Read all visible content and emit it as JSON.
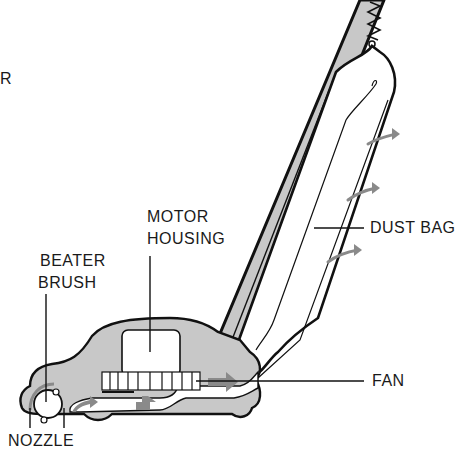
{
  "diagram": {
    "colors": {
      "line": "#111111",
      "body_fill": "#c8c8c8",
      "airflow_arrow": "#8a8a8a",
      "background": "#ffffff"
    },
    "labels": {
      "partial_left": "R",
      "motor_housing_line1": "MOTOR",
      "motor_housing_line2": "HOUSING",
      "beater_brush_line1": "BEATER",
      "beater_brush_line2": "BRUSH",
      "dust_bag": "DUST BAG",
      "fan": "FAN",
      "nozzle": "NOZZLE"
    },
    "parts": [
      "handle",
      "spring",
      "dust bag",
      "motor housing",
      "fan",
      "beater brush",
      "nozzle",
      "airflow arrows"
    ]
  }
}
